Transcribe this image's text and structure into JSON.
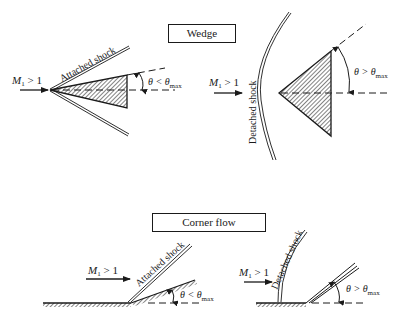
{
  "sections": {
    "wedge": {
      "title": "Wedge"
    },
    "corner": {
      "title": "Corner flow"
    }
  },
  "panels": {
    "wedge_attached": {
      "mach": "M",
      "mach_sub": "1",
      "mach_cond": " > 1",
      "shock_label": "Attached shock",
      "theta": "θ < θ",
      "theta_sub": "max"
    },
    "wedge_detached": {
      "mach": "M",
      "mach_sub": "1",
      "mach_cond": " > 1",
      "shock_label": "Detached shock",
      "theta": "θ > θ",
      "theta_sub": "max"
    },
    "corner_attached": {
      "mach": "M",
      "mach_sub": "1",
      "mach_cond": " > 1",
      "shock_label": "Attached shock",
      "theta": "θ < θ",
      "theta_sub": "max"
    },
    "corner_detached": {
      "mach": "M",
      "mach_sub": "1",
      "mach_cond": " > 1",
      "shock_label": "Detached shock",
      "theta": "θ > θ",
      "theta_sub": "max"
    }
  },
  "colors": {
    "ink": "#1a1a1a",
    "background": "#ffffff"
  }
}
